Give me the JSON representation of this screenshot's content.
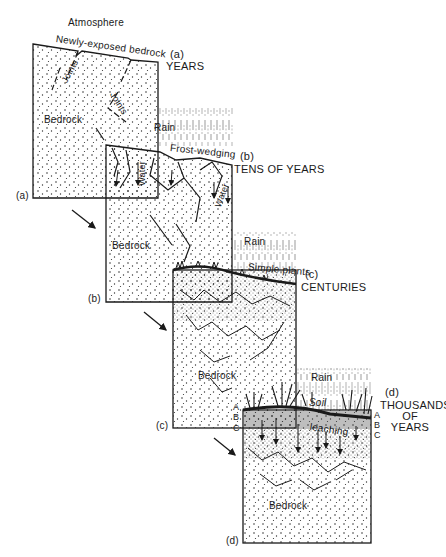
{
  "diagram": {
    "title_top": "Atmosphere",
    "stages": [
      {
        "id": "a",
        "marker": "(a)",
        "side_marker": "(a)",
        "timescale": "YEARS",
        "labels": {
          "surface": "Newly-exposed bedrock",
          "joints_1": "Joints",
          "joints_2": "Joints",
          "rock": "Bedrock"
        }
      },
      {
        "id": "b",
        "marker": "(b)",
        "side_marker": "(b)",
        "timescale": "TENS OF YEARS",
        "labels": {
          "rain": "Rain",
          "process": "Frost-wedging",
          "water_1": "Water",
          "water_2": "Water",
          "rock": "Bedrock"
        }
      },
      {
        "id": "c",
        "marker": "(c)",
        "side_marker": "(c)",
        "timescale": "CENTURIES",
        "labels": {
          "rain": "Rain",
          "vegetation": "Simple plants",
          "rock": "Bedrock"
        },
        "horizons": [
          "A",
          "B",
          "C"
        ]
      },
      {
        "id": "d",
        "marker": "(d)",
        "side_marker": "(d)",
        "timescale_lines": [
          "THOUSANDS",
          "OF",
          "YEARS"
        ],
        "labels": {
          "rain": "Rain",
          "soil": "Soil",
          "process": "leaching",
          "rock": "Bedrock"
        },
        "horizons_left": [
          "A",
          "B",
          "C"
        ],
        "horizons_right": [
          "A",
          "B",
          "C"
        ]
      }
    ],
    "colors": {
      "ink": "#1a1a1a",
      "background": "#ffffff"
    }
  }
}
